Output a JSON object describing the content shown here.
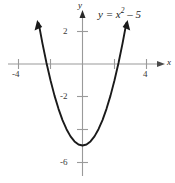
{
  "chart_data": {
    "type": "line",
    "title": "",
    "subtitle": "",
    "xlabel": "x",
    "ylabel": "y",
    "xlim": [
      -5,
      5
    ],
    "ylim": [
      -7,
      3
    ],
    "grid": false,
    "legend": "none",
    "annotations": [
      {
        "name": "equation-label",
        "text": "y = x",
        "exponent": "2",
        "tail": " – 5",
        "full_text": "y = x² – 5",
        "x": 2.2,
        "y": 2.9
      }
    ],
    "axes": {
      "x_axis": {
        "label": "x",
        "tick_values": [
          -4,
          -2,
          0,
          2,
          4
        ],
        "tick_labels": [
          "-4",
          "",
          "",
          "",
          "4"
        ],
        "arrow": "right",
        "color": "#9a9a9a"
      },
      "y_axis": {
        "label": "y",
        "tick_values": [
          2,
          -2,
          -4,
          -6
        ],
        "tick_labels": [
          "2",
          "-2",
          "",
          "-6"
        ],
        "arrow": "up",
        "color": "#9a9a9a"
      }
    },
    "series": [
      {
        "name": "y = x^2 - 5",
        "equation": "y = x^2 - 5",
        "color": "#1a1a1a",
        "vertex": [
          0,
          -5
        ],
        "x_intercepts": [
          -2.236,
          2.236
        ],
        "y_intercept": -5,
        "arrow_ends": "both",
        "x": [
          -2.74,
          -2.5,
          -2.25,
          -2.0,
          -1.75,
          -1.5,
          -1.25,
          -1.0,
          -0.75,
          -0.5,
          -0.25,
          0,
          0.25,
          0.5,
          0.75,
          1.0,
          1.25,
          1.5,
          1.75,
          2.0,
          2.25,
          2.5,
          2.74
        ],
        "values": [
          2.51,
          1.25,
          0.06,
          -1.0,
          -1.94,
          -2.75,
          -3.44,
          -4.0,
          -4.44,
          -4.75,
          -4.94,
          -5.0,
          -4.94,
          -4.75,
          -4.44,
          -4.0,
          -3.44,
          -2.75,
          -1.94,
          -1.0,
          0.06,
          1.25,
          2.51
        ]
      }
    ]
  },
  "labels": {
    "x_neg4": "-4",
    "x_pos4": "4",
    "y_pos2": "2",
    "y_neg2": "-2",
    "y_neg6": "-6",
    "axis_x": "x",
    "axis_y": "y",
    "equation_main": "y = x",
    "equation_exponent": "2",
    "equation_tail": " – 5"
  },
  "colors": {
    "background": "#ffffff",
    "curve": "#1a1a1a",
    "axis": "#9a9a9a",
    "text": "#1a1a1a"
  }
}
